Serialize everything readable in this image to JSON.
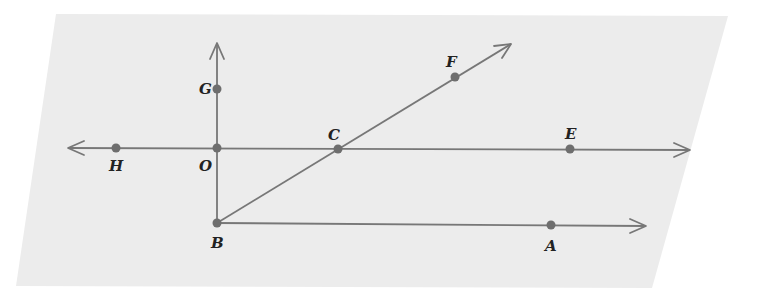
{
  "diagram": {
    "type": "geometry-plane",
    "plane": {
      "shape": "parallelogram",
      "corners": [
        [
          56,
          14
        ],
        [
          728,
          16
        ],
        [
          652,
          288
        ],
        [
          16,
          286
        ]
      ],
      "fill": "#ececec"
    },
    "colors": {
      "line": "#777777",
      "point": "#6e6e6e",
      "label": "#222222"
    },
    "points": [
      {
        "id": "G",
        "label": "G",
        "x": 217,
        "y": 89,
        "lx": 203,
        "ly": 94
      },
      {
        "id": "O",
        "label": "O",
        "x": 217,
        "y": 148,
        "lx": 200,
        "ly": 171
      },
      {
        "id": "H",
        "label": "H",
        "x": 116,
        "y": 148,
        "lx": 110,
        "ly": 171
      },
      {
        "id": "C",
        "label": "C",
        "x": 338,
        "y": 149,
        "lx": 328,
        "ly": 139
      },
      {
        "id": "E",
        "label": "E",
        "x": 570,
        "y": 149,
        "lx": 565,
        "ly": 138
      },
      {
        "id": "F",
        "label": "F",
        "x": 455,
        "y": 77,
        "lx": 446,
        "ly": 67
      },
      {
        "id": "B",
        "label": "B",
        "x": 217,
        "y": 223,
        "lx": 212,
        "ly": 248
      },
      {
        "id": "A",
        "label": "A",
        "x": 551,
        "y": 225,
        "lx": 545,
        "ly": 251
      }
    ],
    "lines": [
      {
        "id": "line-HE",
        "description": "line through H, O, C, E with arrows both ends",
        "x1": 68,
        "y1": 148,
        "x2": 690,
        "y2": 150
      },
      {
        "id": "ray-BG",
        "description": "ray from B through O and G",
        "x1": 217,
        "y1": 223,
        "x2": 217,
        "y2": 43
      },
      {
        "id": "ray-BF",
        "description": "ray from B through C and F",
        "x1": 217,
        "y1": 223,
        "x2": 511,
        "y2": 44
      },
      {
        "id": "ray-BA",
        "description": "ray from B through A",
        "x1": 217,
        "y1": 223,
        "x2": 646,
        "y2": 226
      }
    ]
  }
}
